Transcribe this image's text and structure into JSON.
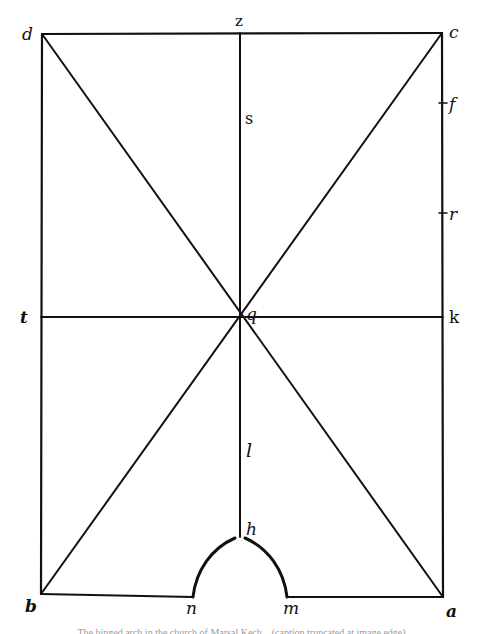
{
  "diagram": {
    "labels": {
      "d": "d",
      "z": "z",
      "c": "c",
      "s": "s",
      "f": "f",
      "r": "r",
      "t": "t",
      "q": "q",
      "k": "k",
      "l": "l",
      "h": "h",
      "b": "b",
      "n": "n",
      "m": "m",
      "a": "a"
    },
    "points": {
      "d": [
        42,
        34
      ],
      "z": [
        240,
        33
      ],
      "c": [
        442,
        33
      ],
      "t": [
        41,
        317
      ],
      "q": [
        240,
        317
      ],
      "k": [
        443,
        317
      ],
      "f": [
        443,
        103
      ],
      "r": [
        443,
        213
      ],
      "s": [
        240,
        118
      ],
      "l": [
        240,
        450
      ],
      "h": [
        240,
        537
      ],
      "b": [
        41,
        594
      ],
      "n": [
        193,
        597
      ],
      "m": [
        287,
        597
      ],
      "a": [
        443,
        597
      ]
    },
    "stroke_color": "#111111",
    "background": "#ffffff"
  },
  "caption": {
    "text": "The hinged arch in the church of Marsal Kech... (caption truncated at image edge)"
  }
}
